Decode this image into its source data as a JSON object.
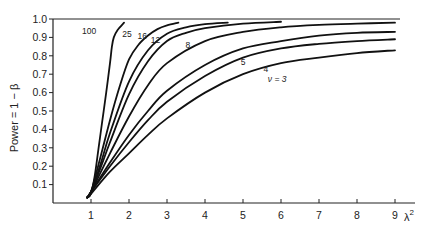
{
  "chart_data": {
    "type": "line",
    "title": "",
    "xlabel": "λ²",
    "ylabel": "Power = 1 − β",
    "xlim": [
      0,
      9.5
    ],
    "ylim": [
      0,
      1.0
    ],
    "grid": false,
    "legend": "inline curve labels",
    "x_ticks": [
      1,
      2,
      3,
      4,
      5,
      6,
      7,
      8,
      9
    ],
    "y_ticks": [
      0.1,
      0.2,
      0.3,
      0.4,
      0.5,
      0.6,
      0.7,
      0.8,
      0.9,
      1.0
    ],
    "y_tick_labels": [
      "0.1",
      "0.2",
      "0.3",
      "0.4",
      "0.5",
      "0.6",
      "0.7",
      "0.8",
      "0.9",
      "1.0"
    ],
    "series": [
      {
        "name": "100",
        "label_pos": [
          0.95,
          0.92
        ],
        "points": [
          [
            0.9,
            0.03
          ],
          [
            1.0,
            0.05
          ],
          [
            1.1,
            0.15
          ],
          [
            1.2,
            0.3
          ],
          [
            1.3,
            0.45
          ],
          [
            1.4,
            0.6
          ],
          [
            1.5,
            0.76
          ],
          [
            1.55,
            0.85
          ],
          [
            1.6,
            0.9
          ],
          [
            1.7,
            0.94
          ],
          [
            1.87,
            0.98
          ]
        ]
      },
      {
        "name": "25",
        "label_pos": [
          1.95,
          0.9
        ],
        "points": [
          [
            0.9,
            0.03
          ],
          [
            1.0,
            0.06
          ],
          [
            1.25,
            0.25
          ],
          [
            1.5,
            0.45
          ],
          [
            1.75,
            0.63
          ],
          [
            2.0,
            0.78
          ],
          [
            2.25,
            0.86
          ],
          [
            2.5,
            0.91
          ],
          [
            2.75,
            0.945
          ],
          [
            3.0,
            0.965
          ],
          [
            3.3,
            0.98
          ]
        ]
      },
      {
        "name": "16",
        "label_pos": [
          2.35,
          0.89
        ],
        "points": [
          [
            0.9,
            0.03
          ],
          [
            1.0,
            0.06
          ],
          [
            1.25,
            0.21
          ],
          [
            1.5,
            0.38
          ],
          [
            2.0,
            0.66
          ],
          [
            2.5,
            0.83
          ],
          [
            3.0,
            0.92
          ],
          [
            3.5,
            0.955
          ],
          [
            4.0,
            0.972
          ],
          [
            4.6,
            0.98
          ]
        ]
      },
      {
        "name": "12",
        "label_pos": [
          2.7,
          0.87
        ],
        "points": [
          [
            0.9,
            0.03
          ],
          [
            1.0,
            0.06
          ],
          [
            1.25,
            0.19
          ],
          [
            1.5,
            0.33
          ],
          [
            2.0,
            0.59
          ],
          [
            2.5,
            0.77
          ],
          [
            3.0,
            0.88
          ],
          [
            3.5,
            0.925
          ],
          [
            4.0,
            0.95
          ],
          [
            5.0,
            0.975
          ],
          [
            6.0,
            0.985
          ]
        ]
      },
      {
        "name": "8",
        "label_pos": [
          3.55,
          0.84
        ],
        "points": [
          [
            0.9,
            0.03
          ],
          [
            1.0,
            0.06
          ],
          [
            1.5,
            0.27
          ],
          [
            2.0,
            0.47
          ],
          [
            2.5,
            0.64
          ],
          [
            3.0,
            0.76
          ],
          [
            4.0,
            0.88
          ],
          [
            5.0,
            0.93
          ],
          [
            6.0,
            0.955
          ],
          [
            7.0,
            0.968
          ],
          [
            8.0,
            0.975
          ],
          [
            9.0,
            0.98
          ]
        ]
      },
      {
        "name": "5",
        "label_pos": [
          5.0,
          0.75
        ],
        "points": [
          [
            0.9,
            0.03
          ],
          [
            1.0,
            0.06
          ],
          [
            1.5,
            0.22
          ],
          [
            2.0,
            0.37
          ],
          [
            2.5,
            0.5
          ],
          [
            3.0,
            0.61
          ],
          [
            4.0,
            0.75
          ],
          [
            5.0,
            0.84
          ],
          [
            6.0,
            0.88
          ],
          [
            7.0,
            0.91
          ],
          [
            8.0,
            0.925
          ],
          [
            9.0,
            0.93
          ]
        ]
      },
      {
        "name": "4",
        "label_pos": [
          5.6,
          0.71
        ],
        "points": [
          [
            0.9,
            0.03
          ],
          [
            1.0,
            0.06
          ],
          [
            1.5,
            0.2
          ],
          [
            2.0,
            0.33
          ],
          [
            2.5,
            0.45
          ],
          [
            3.0,
            0.55
          ],
          [
            4.0,
            0.69
          ],
          [
            5.0,
            0.79
          ],
          [
            6.0,
            0.84
          ],
          [
            7.0,
            0.865
          ],
          [
            8.0,
            0.88
          ],
          [
            9.0,
            0.89
          ]
        ]
      },
      {
        "name": "ν = 3",
        "label_pos": [
          5.9,
          0.66
        ],
        "points": [
          [
            0.9,
            0.03
          ],
          [
            1.0,
            0.05
          ],
          [
            1.5,
            0.17
          ],
          [
            2.0,
            0.27
          ],
          [
            2.5,
            0.37
          ],
          [
            3.0,
            0.46
          ],
          [
            4.0,
            0.6
          ],
          [
            5.0,
            0.7
          ],
          [
            6.0,
            0.76
          ],
          [
            7.0,
            0.79
          ],
          [
            8.0,
            0.815
          ],
          [
            9.0,
            0.83
          ]
        ]
      }
    ]
  },
  "axes": {
    "x_label_main": "λ",
    "x_label_sup": "2",
    "y_label": "Power = 1 − β"
  },
  "colors": {
    "line": "#111111",
    "axis": "#222222",
    "background": "#ffffff"
  }
}
